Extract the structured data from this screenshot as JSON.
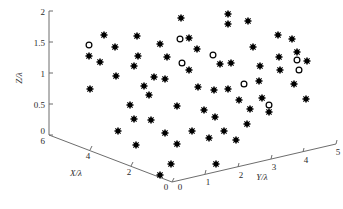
{
  "chart_data": {
    "type": "scatter",
    "title": "",
    "xlabel": "X/λ",
    "ylabel": "Y/λ",
    "zlabel": "Z/λ",
    "projection": "3d",
    "grid": false,
    "legend": "none",
    "xlim": [
      0,
      6
    ],
    "ylim": [
      0,
      5
    ],
    "zlim": [
      0,
      2
    ],
    "xticks": [
      "6",
      "4",
      "2",
      "0"
    ],
    "yticks": [
      "0",
      "1",
      "2",
      "3",
      "4",
      "5"
    ],
    "zticks": [
      "0",
      "0.5",
      "1",
      "1.5",
      "2"
    ],
    "series": [
      {
        "name": "filled-markers",
        "marker": "filled-star-dot",
        "color": "#000000",
        "points": [
          {
            "px": 104,
            "py": 35,
            "z": 1.6
          },
          {
            "px": 137,
            "py": 36,
            "z": 1.58
          },
          {
            "px": 115,
            "py": 47,
            "z": 1.4
          },
          {
            "px": 89,
            "py": 56,
            "z": 1.27
          },
          {
            "px": 138,
            "py": 56,
            "z": 1.27
          },
          {
            "px": 134,
            "py": 66,
            "z": 1.1
          },
          {
            "px": 160,
            "py": 44,
            "z": 1.47
          },
          {
            "px": 167,
            "py": 57,
            "z": 1.26
          },
          {
            "px": 189,
            "py": 38,
            "z": 1.56
          },
          {
            "px": 154,
            "py": 77,
            "z": 0.95
          },
          {
            "px": 165,
            "py": 79,
            "z": 0.91
          },
          {
            "px": 90,
            "py": 89,
            "z": 0.73
          },
          {
            "px": 130,
            "py": 105,
            "z": 0.47
          },
          {
            "px": 177,
            "py": 106,
            "z": 0.46
          },
          {
            "px": 134,
            "py": 119,
            "z": 0.22
          },
          {
            "px": 165,
            "py": 133,
            "z": 0.02
          },
          {
            "px": 136,
            "py": 145,
            "z": 0.0
          },
          {
            "px": 177,
            "py": 144,
            "z": 0.0
          },
          {
            "px": 171,
            "py": 164,
            "z": 0.0
          },
          {
            "px": 160,
            "py": 175,
            "z": 0.0
          },
          {
            "px": 228,
            "py": 14,
            "z": 1.97
          },
          {
            "px": 228,
            "py": 24,
            "z": 1.8
          },
          {
            "px": 248,
            "py": 21,
            "z": 1.85
          },
          {
            "px": 220,
            "py": 64,
            "z": 1.11
          },
          {
            "px": 231,
            "py": 63,
            "z": 1.15
          },
          {
            "px": 198,
            "py": 87,
            "z": 0.77
          },
          {
            "px": 214,
            "py": 90,
            "z": 0.74
          },
          {
            "px": 228,
            "py": 89,
            "z": 0.76
          },
          {
            "px": 260,
            "py": 66,
            "z": 1.18
          },
          {
            "px": 259,
            "py": 81,
            "z": 0.86
          },
          {
            "px": 239,
            "py": 100,
            "z": 0.57
          },
          {
            "px": 215,
            "py": 117,
            "z": 0.26
          },
          {
            "px": 247,
            "py": 124,
            "z": 0.13
          },
          {
            "px": 224,
            "py": 131,
            "z": 0.06
          },
          {
            "px": 236,
            "py": 140,
            "z": 0.0
          },
          {
            "px": 216,
            "py": 164,
            "z": 0.0
          },
          {
            "px": 278,
            "py": 35,
            "z": 1.65
          },
          {
            "px": 292,
            "py": 39,
            "z": 1.56
          },
          {
            "px": 279,
            "py": 57,
            "z": 1.31
          },
          {
            "px": 280,
            "py": 70,
            "z": 1.05
          },
          {
            "px": 307,
            "py": 61,
            "z": 1.21
          },
          {
            "px": 262,
            "py": 98,
            "z": 0.57
          },
          {
            "px": 306,
            "py": 99,
            "z": 0.56
          },
          {
            "px": 181,
            "py": 18,
            "z": 1.56
          },
          {
            "px": 100,
            "py": 62,
            "z": 1.15
          },
          {
            "px": 149,
            "py": 95,
            "z": 0.66
          },
          {
            "px": 197,
            "py": 49,
            "z": 1.39
          },
          {
            "px": 253,
            "py": 47,
            "z": 1.36
          },
          {
            "px": 118,
            "py": 131,
            "z": 0.0
          },
          {
            "px": 151,
            "py": 120,
            "z": 0.1
          },
          {
            "px": 204,
            "py": 110,
            "z": 0.37
          },
          {
            "px": 269,
            "py": 112,
            "z": 0.34
          },
          {
            "px": 192,
            "py": 131,
            "z": 0.05
          },
          {
            "px": 294,
            "py": 84,
            "z": 0.82
          },
          {
            "px": 144,
            "py": 86,
            "z": 0.8
          },
          {
            "px": 209,
            "py": 138,
            "z": 0.0
          },
          {
            "px": 116,
            "py": 76,
            "z": 0.94
          },
          {
            "px": 250,
            "py": 109,
            "z": 0.4
          },
          {
            "px": 189,
            "py": 70,
            "z": 1.06
          },
          {
            "px": 297,
            "py": 52,
            "z": 1.33
          }
        ]
      },
      {
        "name": "open-circle-markers",
        "marker": "open-circle",
        "color": "#ffffff",
        "points": [
          {
            "px": 89,
            "py": 45,
            "z": 1.45
          },
          {
            "px": 180,
            "py": 39,
            "z": 1.55
          },
          {
            "px": 182,
            "py": 63,
            "z": 1.13
          },
          {
            "px": 244,
            "py": 84,
            "z": 0.82
          },
          {
            "px": 269,
            "py": 105,
            "z": 0.44
          },
          {
            "px": 297,
            "py": 60,
            "z": 1.22
          },
          {
            "px": 299,
            "py": 70,
            "z": 1.08
          },
          {
            "px": 213,
            "py": 55,
            "z": 1.3
          }
        ]
      }
    ]
  },
  "axes": {
    "z": {
      "label": "Z/λ",
      "ticks": [
        {
          "text": "2",
          "px": 40,
          "py": 12
        },
        {
          "text": "1.5",
          "px": 34,
          "py": 43
        },
        {
          "text": "1",
          "px": 40,
          "py": 74
        },
        {
          "text": "0.5",
          "px": 34,
          "py": 105
        },
        {
          "text": "0",
          "px": 40,
          "py": 130
        }
      ]
    },
    "x": {
      "label": "X/λ",
      "ticks": [
        {
          "text": "6",
          "px": 40,
          "py": 140
        },
        {
          "text": "4",
          "px": 84,
          "py": 157
        },
        {
          "text": "2",
          "px": 130,
          "py": 172
        },
        {
          "text": "0",
          "px": 162,
          "py": 187
        }
      ]
    },
    "y": {
      "label": "Y/λ",
      "ticks": [
        {
          "text": "0",
          "px": 177,
          "py": 187
        },
        {
          "text": "1",
          "px": 207,
          "py": 182
        },
        {
          "text": "2",
          "px": 240,
          "py": 174
        },
        {
          "text": "3",
          "px": 271,
          "py": 167
        },
        {
          "text": "4",
          "px": 301,
          "py": 160
        },
        {
          "text": "5",
          "px": 331,
          "py": 153
        }
      ]
    }
  }
}
